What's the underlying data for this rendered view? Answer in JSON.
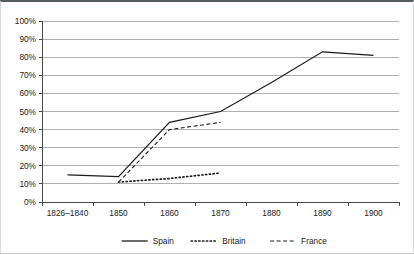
{
  "chart_data": {
    "type": "line",
    "title": "",
    "subtitle": "",
    "xlabel": "",
    "ylabel": "",
    "categories": [
      "1826–1840",
      "1850",
      "1860",
      "1870",
      "1880",
      "1890",
      "1900"
    ],
    "ylim": [
      0,
      100
    ],
    "ytick_labels": [
      "0%",
      "10%",
      "20%",
      "30%",
      "40%",
      "50%",
      "60%",
      "70%",
      "80%",
      "90%",
      "100%"
    ],
    "ytick_values": [
      0,
      10,
      20,
      30,
      40,
      50,
      60,
      70,
      80,
      90,
      100
    ],
    "grid": "horizontal",
    "legend_position": "bottom-center",
    "series": [
      {
        "name": "Spain",
        "style": "solid",
        "color": "#1c1c1c",
        "x": [
          "1826–1840",
          "1850",
          "1860",
          "1870",
          "1880",
          "1890",
          "1900"
        ],
        "values": [
          15,
          14,
          44,
          50,
          66,
          83,
          81
        ]
      },
      {
        "name": "Britain",
        "style": "dotted",
        "color": "#1c1c1c",
        "x": [
          "1850",
          "1860",
          "1870"
        ],
        "values": [
          11,
          13,
          16
        ]
      },
      {
        "name": "France",
        "style": "dashed",
        "color": "#1c1c1c",
        "x": [
          "1850",
          "1860",
          "1870"
        ],
        "values": [
          11,
          40,
          44
        ]
      }
    ]
  },
  "axis": {
    "y_labels": [
      "100%",
      "90%",
      "80%",
      "70%",
      "60%",
      "50%",
      "40%",
      "30%",
      "20%",
      "10%",
      "0%"
    ],
    "x_labels": [
      "1826–1840",
      "1850",
      "1860",
      "1870",
      "1880",
      "1890",
      "1900"
    ]
  },
  "legend": {
    "entries": [
      {
        "label": "Spain",
        "style": "solid"
      },
      {
        "label": "Britain",
        "style": "dotted"
      },
      {
        "label": "France",
        "style": "dashed"
      }
    ]
  }
}
